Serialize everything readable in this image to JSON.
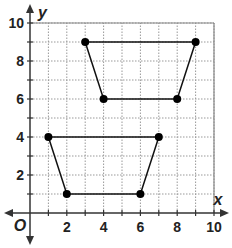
{
  "chart_data": {
    "type": "scatter",
    "title": "",
    "xlabel": "x",
    "ylabel": "y",
    "origin_label": "O",
    "xlim": [
      0,
      10
    ],
    "ylim": [
      0,
      10
    ],
    "grid": true,
    "grid_style": "dotted",
    "x_ticks": [
      2,
      4,
      6,
      8,
      10
    ],
    "y_ticks": [
      2,
      4,
      6,
      8,
      10
    ],
    "shapes": [
      {
        "name": "upper-trapezoid",
        "type": "polygon",
        "vertices": [
          [
            3,
            9
          ],
          [
            9,
            9
          ],
          [
            8,
            6
          ],
          [
            4,
            6
          ]
        ]
      },
      {
        "name": "lower-trapezoid",
        "type": "polygon",
        "vertices": [
          [
            1,
            4
          ],
          [
            7,
            4
          ],
          [
            6,
            1
          ],
          [
            2,
            1
          ]
        ]
      }
    ]
  },
  "labels": {
    "x_axis": "x",
    "y_axis": "y",
    "origin": "O",
    "x_ticks": [
      "2",
      "4",
      "6",
      "8",
      "10"
    ],
    "y_ticks": [
      "2",
      "4",
      "6",
      "8",
      "10"
    ]
  },
  "colors": {
    "grid": "#999999",
    "axis": "#333333",
    "shape": "#111111",
    "point": "#000000"
  }
}
